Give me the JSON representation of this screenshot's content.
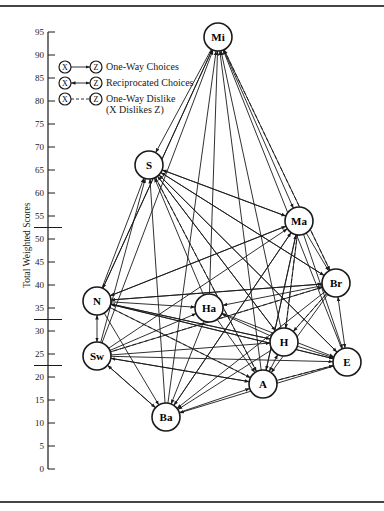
{
  "axis": {
    "label": "Total Weighted Scores",
    "ticks": [
      95,
      90,
      85,
      80,
      75,
      70,
      65,
      60,
      55,
      50,
      45,
      40,
      35,
      30,
      25,
      20,
      15,
      10,
      5,
      0
    ],
    "band_dividers": [
      52.5,
      32.5,
      22.5
    ]
  },
  "legend": {
    "items": [
      {
        "from": "X",
        "to": "Z",
        "type": "one-way",
        "label": "One-Way Choices"
      },
      {
        "from": "X",
        "to": "Z",
        "type": "reciprocated",
        "label": "Reciprocated Choices"
      },
      {
        "from": "X",
        "to": "Z",
        "type": "dislike",
        "label": "One-Way Dislike",
        "sublabel": "(X Dislikes Z)"
      }
    ]
  },
  "nodes": [
    {
      "id": "Mi",
      "x": 218,
      "y": 37
    },
    {
      "id": "S",
      "x": 149,
      "y": 165
    },
    {
      "id": "Ma",
      "x": 299,
      "y": 221
    },
    {
      "id": "Br",
      "x": 336,
      "y": 283
    },
    {
      "id": "N",
      "x": 97,
      "y": 301
    },
    {
      "id": "Ha",
      "x": 209,
      "y": 308
    },
    {
      "id": "H",
      "x": 284,
      "y": 342
    },
    {
      "id": "E",
      "x": 347,
      "y": 362
    },
    {
      "id": "Sw",
      "x": 97,
      "y": 356
    },
    {
      "id": "A",
      "x": 263,
      "y": 384
    },
    {
      "id": "Ba",
      "x": 166,
      "y": 417
    }
  ],
  "edges": [
    {
      "from": "N",
      "to": "Mi",
      "type": "one-way"
    },
    {
      "from": "Sw",
      "to": "Mi",
      "type": "one-way"
    },
    {
      "from": "Ba",
      "to": "Mi",
      "type": "one-way"
    },
    {
      "from": "Ha",
      "to": "Mi",
      "type": "one-way"
    },
    {
      "from": "A",
      "to": "Mi",
      "type": "one-way"
    },
    {
      "from": "H",
      "to": "Mi",
      "type": "one-way"
    },
    {
      "from": "E",
      "to": "Mi",
      "type": "one-way"
    },
    {
      "from": "Mi",
      "to": "S",
      "type": "one-way"
    },
    {
      "from": "Mi",
      "to": "Br",
      "type": "reciprocated"
    },
    {
      "from": "Br",
      "to": "Mi",
      "type": "dislike"
    },
    {
      "from": "N",
      "to": "S",
      "type": "one-way"
    },
    {
      "from": "Sw",
      "to": "S",
      "type": "one-way"
    },
    {
      "from": "Ba",
      "to": "S",
      "type": "one-way"
    },
    {
      "from": "Ma",
      "to": "S",
      "type": "one-way"
    },
    {
      "from": "Br",
      "to": "S",
      "type": "one-way"
    },
    {
      "from": "H",
      "to": "S",
      "type": "one-way"
    },
    {
      "from": "E",
      "to": "S",
      "type": "one-way"
    },
    {
      "from": "A",
      "to": "S",
      "type": "dislike"
    },
    {
      "from": "S",
      "to": "Ma",
      "type": "one-way"
    },
    {
      "from": "Mi",
      "to": "Ma",
      "type": "one-way"
    },
    {
      "from": "N",
      "to": "Ma",
      "type": "one-way"
    },
    {
      "from": "Sw",
      "to": "Ma",
      "type": "one-way"
    },
    {
      "from": "Ba",
      "to": "Ma",
      "type": "one-way"
    },
    {
      "from": "A",
      "to": "Ma",
      "type": "one-way"
    },
    {
      "from": "H",
      "to": "Ma",
      "type": "dislike"
    },
    {
      "from": "Ma",
      "to": "E",
      "type": "one-way"
    },
    {
      "from": "Ma",
      "to": "Br",
      "type": "one-way"
    },
    {
      "from": "S",
      "to": "Br",
      "type": "one-way"
    },
    {
      "from": "N",
      "to": "Br",
      "type": "one-way"
    },
    {
      "from": "Sw",
      "to": "Br",
      "type": "one-way"
    },
    {
      "from": "Br",
      "to": "E",
      "type": "reciprocated"
    },
    {
      "from": "Br",
      "to": "Ha",
      "type": "one-way"
    },
    {
      "from": "Br",
      "to": "A",
      "type": "one-way"
    },
    {
      "from": "H",
      "to": "Br",
      "type": "dislike"
    },
    {
      "from": "N",
      "to": "Sw",
      "type": "reciprocated"
    },
    {
      "from": "N",
      "to": "Ha",
      "type": "one-way"
    },
    {
      "from": "N",
      "to": "E",
      "type": "one-way"
    },
    {
      "from": "N",
      "to": "A",
      "type": "one-way"
    },
    {
      "from": "N",
      "to": "H",
      "type": "one-way"
    },
    {
      "from": "Ma",
      "to": "N",
      "type": "one-way"
    },
    {
      "from": "Br",
      "to": "N",
      "type": "one-way"
    },
    {
      "from": "H",
      "to": "N",
      "type": "one-way"
    },
    {
      "from": "E",
      "to": "N",
      "type": "one-way"
    },
    {
      "from": "A",
      "to": "N",
      "type": "dislike"
    },
    {
      "from": "Mi",
      "to": "N",
      "type": "one-way"
    },
    {
      "from": "S",
      "to": "H",
      "type": "one-way"
    },
    {
      "from": "S",
      "to": "E",
      "type": "one-way"
    },
    {
      "from": "S",
      "to": "A",
      "type": "one-way"
    },
    {
      "from": "Sw",
      "to": "Ha",
      "type": "one-way"
    },
    {
      "from": "Sw",
      "to": "E",
      "type": "one-way"
    },
    {
      "from": "Sw",
      "to": "A",
      "type": "one-way"
    },
    {
      "from": "Sw",
      "to": "H",
      "type": "one-way"
    },
    {
      "from": "Br",
      "to": "Sw",
      "type": "dislike"
    },
    {
      "from": "A",
      "to": "Sw",
      "type": "one-way"
    },
    {
      "from": "N",
      "to": "Ba",
      "type": "one-way"
    },
    {
      "from": "Sw",
      "to": "Ba",
      "type": "one-way"
    },
    {
      "from": "Ha",
      "to": "Ba",
      "type": "one-way"
    },
    {
      "from": "Ma",
      "to": "Ba",
      "type": "one-way"
    },
    {
      "from": "Br",
      "to": "Ba",
      "type": "one-way"
    },
    {
      "from": "H",
      "to": "Ba",
      "type": "one-way"
    },
    {
      "from": "E",
      "to": "Ba",
      "type": "one-way"
    },
    {
      "from": "Ba",
      "to": "A",
      "type": "one-way"
    },
    {
      "from": "Ba",
      "to": "Sw",
      "type": "one-way"
    },
    {
      "from": "Ha",
      "to": "A",
      "type": "one-way"
    },
    {
      "from": "Ha",
      "to": "E",
      "type": "one-way"
    },
    {
      "from": "H",
      "to": "Ha",
      "type": "one-way"
    },
    {
      "from": "H",
      "to": "E",
      "type": "one-way"
    },
    {
      "from": "A",
      "to": "H",
      "type": "reciprocated"
    },
    {
      "from": "A",
      "to": "E",
      "type": "one-way"
    },
    {
      "from": "Br",
      "to": "H",
      "type": "one-way"
    },
    {
      "from": "E",
      "to": "A",
      "type": "dislike"
    },
    {
      "from": "Ma",
      "to": "H",
      "type": "one-way"
    },
    {
      "from": "Ma",
      "to": "A",
      "type": "one-way"
    },
    {
      "from": "Ha",
      "to": "S",
      "type": "one-way"
    }
  ]
}
